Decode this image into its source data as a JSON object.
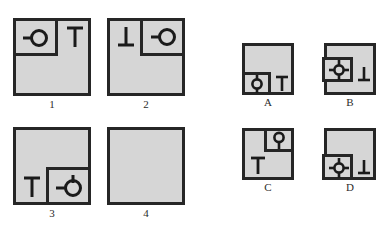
{
  "header": {
    "cropped_text": "—··············"
  },
  "puzzle": {
    "type": "visual-sequence-matrix",
    "prompt_cells": [
      {
        "id": "1",
        "label": "1",
        "subbox": {
          "corner": "top-left",
          "width_pct": 55,
          "height_pct": 48
        },
        "glyphs": [
          {
            "name": "circle-with-left-stem-icon",
            "symbol": "-O",
            "location": "inside-subbox"
          },
          {
            "name": "tee-icon",
            "symbol": "T",
            "location": "top-right-outside-subbox"
          }
        ]
      },
      {
        "id": "2",
        "label": "2",
        "subbox": {
          "corner": "top-right",
          "width_pct": 55,
          "height_pct": 48
        },
        "glyphs": [
          {
            "name": "inverted-tee-icon",
            "symbol": "⊥",
            "location": "top-left-outside-subbox"
          },
          {
            "name": "circle-with-left-stem-icon",
            "symbol": "-O",
            "location": "inside-subbox"
          }
        ]
      },
      {
        "id": "3",
        "label": "3",
        "subbox": {
          "corner": "bottom-right",
          "width_pct": 55,
          "height_pct": 48
        },
        "glyphs": [
          {
            "name": "tee-icon",
            "symbol": "T",
            "location": "bottom-left-outside-subbox"
          },
          {
            "name": "circle-with-left-stem-and-top-stem-icon",
            "symbol": "-Ø",
            "location": "inside-subbox"
          }
        ]
      },
      {
        "id": "4",
        "label": "4",
        "subbox": null,
        "glyphs": []
      }
    ],
    "options": [
      {
        "id": "A",
        "label": "A",
        "subbox": {
          "corner": "bottom-left",
          "width_pct": 55,
          "height_pct": 45
        },
        "glyphs": [
          {
            "name": "circle-with-vertical-stems-icon",
            "symbol": "Ø",
            "location": "inside-subbox"
          },
          {
            "name": "tee-icon",
            "symbol": "T",
            "location": "bottom-right-outside-subbox"
          }
        ]
      },
      {
        "id": "B",
        "label": "B",
        "subbox": {
          "corner": "middle-left",
          "width_pct": 55,
          "height_pct": 45
        },
        "glyphs": [
          {
            "name": "circle-with-four-stems-icon",
            "symbol": "⊕",
            "location": "inside-subbox"
          },
          {
            "name": "inverted-tee-icon",
            "symbol": "⊥",
            "location": "bottom-right-outside-subbox"
          }
        ]
      },
      {
        "id": "C",
        "label": "C",
        "subbox": {
          "corner": "top-right",
          "width_pct": 42,
          "height_pct": 45
        },
        "glyphs": [
          {
            "name": "circle-with-bottom-stem-icon",
            "symbol": "♀",
            "location": "inside-subbox"
          },
          {
            "name": "tee-icon",
            "symbol": "T",
            "location": "bottom-left-outside-subbox"
          }
        ]
      },
      {
        "id": "D",
        "label": "D",
        "subbox": {
          "corner": "bottom-left",
          "width_pct": 55,
          "height_pct": 45
        },
        "glyphs": [
          {
            "name": "circle-with-four-stems-icon",
            "symbol": "⊕",
            "location": "inside-subbox"
          },
          {
            "name": "inverted-tee-icon",
            "symbol": "⊥",
            "location": "bottom-right-outside-subbox"
          }
        ]
      }
    ]
  },
  "colors": {
    "panel_fill": "#d6d6d6",
    "panel_stroke": "#262626",
    "glyph_stroke": "#1a1a1a",
    "page_background": "#ffffff",
    "label_text": "#2b2b2b"
  }
}
